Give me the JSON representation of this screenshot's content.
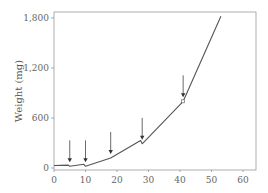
{
  "chart_data": {
    "type": "line",
    "title": "",
    "xlabel": "",
    "ylabel": "Weight (mg)",
    "xlim": [
      0,
      63
    ],
    "ylim": [
      0,
      1900
    ],
    "x_ticks": [
      0,
      10,
      20,
      30,
      40,
      50,
      60
    ],
    "x_tick_labels": [
      "0",
      "10",
      "20",
      "30",
      "40",
      "50",
      "60"
    ],
    "y_ticks": [
      0,
      600,
      1200,
      1800
    ],
    "y_tick_labels": [
      "0",
      "600",
      "1,200",
      "1,800"
    ],
    "grid": false,
    "legend": null,
    "series": [
      {
        "name": "Weight",
        "x": [
          0,
          4.5,
          5,
          9.5,
          10,
          18,
          27.5,
          28,
          41,
          53
        ],
        "y": [
          30,
          35,
          20,
          45,
          20,
          120,
          330,
          290,
          800,
          1820
        ]
      }
    ],
    "annotations": [
      {
        "type": "arrow",
        "x": 5,
        "label": ""
      },
      {
        "type": "arrow",
        "x": 10,
        "label": ""
      },
      {
        "type": "arrow",
        "x": 18,
        "label": ""
      },
      {
        "type": "arrow",
        "x": 28,
        "label": ""
      },
      {
        "type": "arrow",
        "x": 41,
        "label": ""
      },
      {
        "type": "marker",
        "shape": "square",
        "x": 41,
        "y": 800
      }
    ]
  },
  "colors": {
    "line": "#555555",
    "axis": "#777777",
    "text": "#666666"
  }
}
